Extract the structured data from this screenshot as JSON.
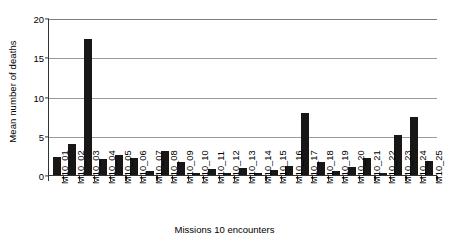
{
  "chart_data": {
    "type": "bar",
    "title": "",
    "xlabel": "Missions 10 encounters",
    "ylabel": "Mean number of deaths",
    "ylim": [
      0,
      20
    ],
    "yticks": [
      0,
      5,
      10,
      15,
      20
    ],
    "grid": true,
    "legend": null,
    "bar_color": "#171717",
    "categories": [
      "M10_01",
      "M10_02",
      "M10_03",
      "M10_04",
      "M10_05",
      "M10_06",
      "M10_07",
      "M10_08",
      "M10_09",
      "M10_10",
      "M10_11",
      "M10_12",
      "M10_13",
      "M10_14",
      "M10_15",
      "M10_16",
      "M10_17",
      "M10_18",
      "M10_19",
      "M10_20",
      "M10_21",
      "M10_22",
      "M10_23",
      "M10_24",
      "M10_25"
    ],
    "values": [
      2.3,
      3.9,
      17.3,
      2.1,
      2.5,
      2.2,
      0.5,
      3.1,
      1.7,
      0.3,
      0.8,
      0.25,
      0.9,
      0.25,
      0.6,
      1.2,
      7.9,
      1.7,
      0.45,
      1.0,
      2.2,
      0.2,
      5.1,
      7.4,
      1.8
    ]
  }
}
